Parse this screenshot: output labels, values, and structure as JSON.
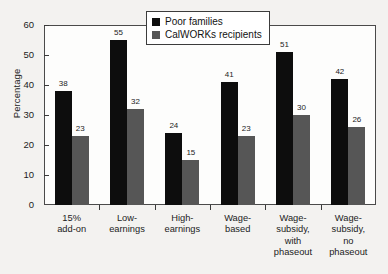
{
  "chart_data": {
    "type": "bar",
    "title": "",
    "xlabel": "",
    "ylabel": "Percentage",
    "ylim": [
      0,
      60
    ],
    "yticks": [
      0,
      10,
      20,
      30,
      40,
      50,
      60
    ],
    "ytick_labels": [
      "0",
      "10",
      "20",
      "30",
      "40",
      "50",
      "60"
    ],
    "grid": false,
    "legend_position": "top-center",
    "categories": [
      "15%\nadd-on",
      "Low-\nearnings",
      "High-\nearnings",
      "Wage-\nbased",
      "Wage-\nsubsidy,\nwith\nphaseout",
      "Wage-\nsubsidy,\nno\nphaseout"
    ],
    "series": [
      {
        "name": "Poor families",
        "color": "#0d0d0d",
        "values": [
          38,
          55,
          24,
          41,
          51,
          42
        ],
        "value_labels": [
          "38",
          "55",
          "24",
          "41",
          "51",
          "42"
        ]
      },
      {
        "name": "CalWORKs recipients",
        "color": "#565656",
        "values": [
          23,
          32,
          15,
          23,
          30,
          26
        ],
        "value_labels": [
          "23",
          "32",
          "15",
          "23",
          "30",
          "26"
        ]
      }
    ]
  },
  "legend": {
    "items": [
      {
        "label": "Poor families",
        "color": "#0d0d0d"
      },
      {
        "label": "CalWORKs recipients",
        "color": "#565656"
      }
    ]
  },
  "axes": {
    "y_title": "Percentage"
  }
}
